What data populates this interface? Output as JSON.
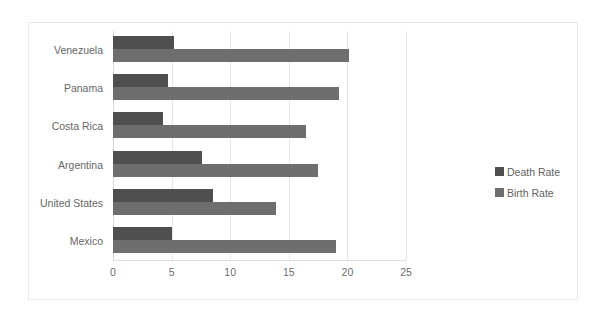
{
  "chart_data": {
    "type": "bar",
    "orientation": "horizontal",
    "title": "",
    "xlabel": "",
    "ylabel": "",
    "categories": [
      "Venezuela",
      "Panama",
      "Costa Rica",
      "Argentina",
      "United States",
      "Mexico"
    ],
    "series": [
      {
        "name": "Death Rate",
        "color": "#4f4f4f",
        "values": [
          5.2,
          4.7,
          4.3,
          7.6,
          8.5,
          5.0
        ]
      },
      {
        "name": "Birth Rate",
        "color": "#6e6e6e",
        "values": [
          20.1,
          19.3,
          16.5,
          17.5,
          13.9,
          19.0
        ]
      }
    ],
    "xlim": [
      0,
      25
    ],
    "xticks": [
      0,
      5,
      10,
      15,
      20,
      25
    ],
    "xtick_labels": [
      "0",
      "5",
      "10",
      "15",
      "20",
      "25"
    ],
    "grid": true,
    "grid_axis": "x",
    "legend_position": "right",
    "legend_entries": [
      "Death Rate",
      "Birth Rate"
    ]
  },
  "colors": {
    "death_rate": "#4f4f4f",
    "birth_rate": "#6e6e6e",
    "gridline": "#e4e4e4",
    "frame_border": "#e8e8e8",
    "text": "#666666",
    "background": "#ffffff"
  }
}
